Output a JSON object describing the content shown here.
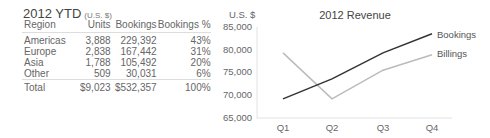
{
  "table": {
    "title": "2012 YTD",
    "unit": "(U.S. $)",
    "columns": [
      "Region",
      "Units",
      "Bookings",
      "Bookings %"
    ],
    "rows": [
      [
        "Americas",
        "3,888",
        "229,392",
        "43%"
      ],
      [
        "Europe",
        "2,838",
        "167,442",
        "31%"
      ],
      [
        "Asia",
        "1,788",
        "105,492",
        "20%"
      ],
      [
        "Other",
        "509",
        "30,031",
        "6%"
      ]
    ],
    "total": [
      "Total",
      "$9,023",
      "$532,357",
      "100%"
    ]
  },
  "chart_data": {
    "type": "line",
    "title": "2012 Revenue",
    "ylabel": "U.S. $",
    "xlabel": "",
    "categories": [
      "Q1",
      "Q2",
      "Q3",
      "Q4"
    ],
    "series": [
      {
        "name": "Bookings",
        "color": "#333333",
        "values": [
          69200,
          73600,
          79300,
          83500
        ]
      },
      {
        "name": "Billings",
        "color": "#bbbbbb",
        "values": [
          79300,
          69200,
          75500,
          78900
        ]
      }
    ],
    "ylim": [
      65000,
      85000
    ],
    "yticks": [
      "85,000",
      "80,000",
      "75,000",
      "70,000",
      "65,000"
    ],
    "grid": false,
    "legend_position": "right, inline at line ends"
  }
}
